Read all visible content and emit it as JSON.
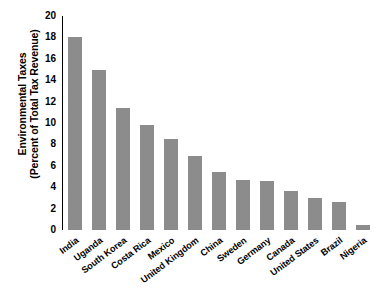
{
  "chart_data": {
    "type": "bar",
    "title": "",
    "subtitle": "",
    "xlabel": "",
    "ylabel_line1": "Environmental Taxes",
    "ylabel_line2": "(Percent of Total Tax Revenue)",
    "categories": [
      "India",
      "Uganda",
      "South Korea",
      "Costa Rica",
      "Mexico",
      "United Kingdom",
      "China",
      "Sweden",
      "Germany",
      "Canada",
      "United States",
      "Brazil",
      "Nigeria"
    ],
    "values": [
      18.0,
      15.0,
      11.4,
      9.8,
      8.5,
      6.9,
      5.4,
      4.7,
      4.6,
      3.6,
      3.0,
      2.6,
      0.5
    ],
    "ylim": [
      0,
      20
    ],
    "yticks": [
      0,
      2,
      4,
      6,
      8,
      10,
      12,
      14,
      16,
      18,
      20
    ],
    "ytick_labels": [
      "0",
      "2",
      "4",
      "6",
      "8",
      "10",
      "12",
      "14",
      "16",
      "18",
      "20"
    ],
    "grid": false,
    "legend": null,
    "bar_color": "#8c8c8c",
    "axis_color": "#000000",
    "background": "#ffffff"
  }
}
